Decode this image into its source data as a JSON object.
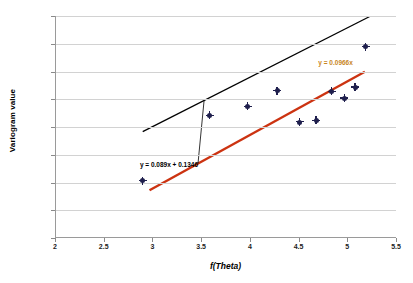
{
  "chart_data": {
    "type": "scatter",
    "title": "",
    "xlabel": "f(Theta)",
    "ylabel": "Variogram value",
    "xlim": [
      2,
      5.5
    ],
    "ylim": [
      0.2,
      0.6
    ],
    "xticks": [
      "2",
      "2.5",
      "3",
      "3.5",
      "4",
      "4.5",
      "5",
      "5.5"
    ],
    "xtick_values": [
      2,
      2.5,
      3,
      3.5,
      4,
      4.5,
      5,
      5.5
    ],
    "yticks": [
      "0.2",
      "0.25",
      "0.3",
      "0.35",
      "0.4",
      "0.45",
      "0.5",
      "0.55",
      "0.6"
    ],
    "ytick_values": [
      0.2,
      0.25,
      0.3,
      0.35,
      0.4,
      0.45,
      0.5,
      0.55,
      0.6
    ],
    "grid": "horizontal",
    "legend": "none",
    "series": [
      {
        "name": "Variogram data points",
        "type": "scatter",
        "marker": "cross-diamond",
        "color": "#1f1f4d",
        "points": [
          {
            "x": 2.89,
            "y": 0.303
          },
          {
            "x": 3.58,
            "y": 0.421
          },
          {
            "x": 3.97,
            "y": 0.437
          },
          {
            "x": 4.27,
            "y": 0.465
          },
          {
            "x": 4.5,
            "y": 0.409
          },
          {
            "x": 4.67,
            "y": 0.412
          },
          {
            "x": 4.83,
            "y": 0.464
          },
          {
            "x": 4.96,
            "y": 0.452
          },
          {
            "x": 5.07,
            "y": 0.472
          },
          {
            "x": 5.18,
            "y": 0.545
          }
        ]
      },
      {
        "name": "Linear trendline with intercept",
        "type": "line",
        "color": "#000000",
        "equation": "y = 0.089x + 0.1346",
        "slope": 0.089,
        "intercept": 0.1346,
        "x_start": 2.89,
        "x_end": 5.22
      },
      {
        "name": "Linear trendline through origin",
        "type": "line",
        "color": "#cc3311",
        "equation": "y = 0.0966x",
        "slope": 0.0966,
        "intercept": 0,
        "x_start": 2.96,
        "x_end": 5.17
      }
    ],
    "annotations": [
      {
        "name": "black-trendline-equation",
        "text": "y = 0.089x + 0.1346",
        "color": "#000000",
        "x": 3.17,
        "y": 0.334
      },
      {
        "name": "red-trendline-equation",
        "text": "y = 0.0966x",
        "color": "#c8861e",
        "x": 4.88,
        "y": 0.517
      }
    ]
  }
}
